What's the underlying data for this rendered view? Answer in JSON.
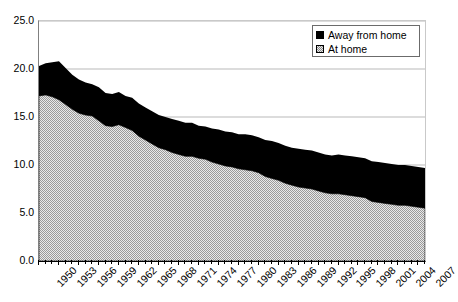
{
  "chart_data": {
    "type": "area",
    "title": "",
    "xlabel": "",
    "ylabel": "",
    "stacked": true,
    "grid": true,
    "legend_position": "top-right",
    "xlim": [
      1950,
      2008
    ],
    "ylim": [
      0.0,
      25.0
    ],
    "y_ticks": [
      "25.0",
      "20.0",
      "15.0",
      "10.0",
      "5.0",
      "0.0"
    ],
    "y_tick_values": [
      25.0,
      20.0,
      15.0,
      10.0,
      5.0,
      0.0
    ],
    "x_tick_labels": [
      "1950",
      "1953",
      "1956",
      "1959",
      "1962",
      "1965",
      "1968",
      "1971",
      "1974",
      "1977",
      "1980",
      "1983",
      "1986",
      "1989",
      "1992",
      "1995",
      "1998",
      "2001",
      "2004",
      "2007"
    ],
    "x": [
      1950,
      1951,
      1952,
      1953,
      1954,
      1955,
      1956,
      1957,
      1958,
      1959,
      1960,
      1961,
      1962,
      1963,
      1964,
      1965,
      1966,
      1967,
      1968,
      1969,
      1970,
      1971,
      1972,
      1973,
      1974,
      1975,
      1976,
      1977,
      1978,
      1979,
      1980,
      1981,
      1982,
      1983,
      1984,
      1985,
      1986,
      1987,
      1988,
      1989,
      1990,
      1991,
      1992,
      1993,
      1994,
      1995,
      1996,
      1997,
      1998,
      1999,
      2000,
      2001,
      2002,
      2003,
      2004,
      2005,
      2006,
      2007,
      2008
    ],
    "series": [
      {
        "name": "At home",
        "fill": "dotted",
        "values": [
          17.2,
          17.3,
          17.1,
          16.8,
          16.3,
          15.8,
          15.4,
          15.2,
          15.1,
          14.6,
          14.1,
          14.0,
          14.2,
          13.9,
          13.6,
          13.0,
          12.6,
          12.2,
          11.8,
          11.6,
          11.3,
          11.1,
          10.9,
          10.9,
          10.7,
          10.6,
          10.3,
          10.1,
          9.9,
          9.8,
          9.6,
          9.5,
          9.4,
          9.2,
          8.8,
          8.6,
          8.4,
          8.1,
          7.9,
          7.7,
          7.6,
          7.5,
          7.3,
          7.1,
          7.0,
          7.0,
          6.9,
          6.8,
          6.7,
          6.6,
          6.2,
          6.1,
          6.0,
          5.9,
          5.8,
          5.8,
          5.7,
          5.6,
          5.5
        ],
        "color": "#e8e8e8"
      },
      {
        "name": "Away from home",
        "fill": "solid",
        "values": [
          3.1,
          3.3,
          3.6,
          4.0,
          3.8,
          3.6,
          3.5,
          3.4,
          3.3,
          3.5,
          3.4,
          3.4,
          3.4,
          3.3,
          3.4,
          3.4,
          3.4,
          3.4,
          3.4,
          3.4,
          3.5,
          3.5,
          3.5,
          3.5,
          3.4,
          3.4,
          3.5,
          3.6,
          3.6,
          3.6,
          3.6,
          3.7,
          3.7,
          3.7,
          3.8,
          3.9,
          3.9,
          3.9,
          3.9,
          4.0,
          4.0,
          4.0,
          4.0,
          4.0,
          4.0,
          4.1,
          4.1,
          4.1,
          4.1,
          4.1,
          4.2,
          4.2,
          4.2,
          4.2,
          4.2,
          4.2,
          4.2,
          4.2,
          4.2
        ],
        "color": "#000000"
      }
    ],
    "totals": [
      20.3,
      20.6,
      20.7,
      20.8,
      20.1,
      19.4,
      18.9,
      18.6,
      18.4,
      18.1,
      17.5,
      17.4,
      17.6,
      17.2,
      17.0,
      16.4,
      16.0,
      15.6,
      15.2,
      15.0,
      14.8,
      14.6,
      14.4,
      14.4,
      14.1,
      14.0,
      13.8,
      13.7,
      13.5,
      13.4,
      13.2,
      13.2,
      13.1,
      12.9,
      12.6,
      12.5,
      12.3,
      12.0,
      11.8,
      11.7,
      11.6,
      11.5,
      11.3,
      11.1,
      11.0,
      11.1,
      11.0,
      10.9,
      10.8,
      10.7,
      10.4,
      10.3,
      10.2,
      10.1,
      10.0,
      10.0,
      9.9,
      9.8,
      9.7
    ]
  },
  "legend": {
    "items": [
      {
        "label": "Away from home",
        "swatch": "black-square-icon"
      },
      {
        "label": "At home",
        "swatch": "dotted-square-icon"
      }
    ]
  }
}
